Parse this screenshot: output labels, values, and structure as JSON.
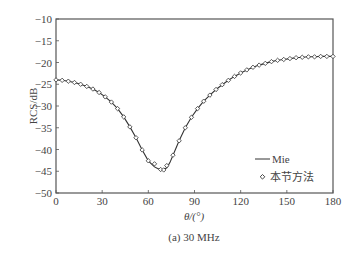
{
  "chart_data": {
    "type": "line",
    "title": "",
    "caption": "(a) 30 MHz",
    "xlabel": "θ/(°)",
    "ylabel": "RCS/dB",
    "xlim": [
      0,
      180
    ],
    "ylim": [
      -50,
      -10
    ],
    "xticks": [
      0,
      30,
      60,
      90,
      120,
      150,
      180
    ],
    "yticks": [
      -10,
      -15,
      -20,
      -25,
      -30,
      -35,
      -40,
      -45,
      -50
    ],
    "grid": false,
    "legend_position": "lower right",
    "series": [
      {
        "name": "Mie",
        "style": "solid-line",
        "x": [
          0,
          4,
          8,
          12,
          16,
          20,
          24,
          28,
          32,
          36,
          40,
          44,
          48,
          52,
          56,
          60,
          64,
          66,
          68,
          70,
          72,
          74,
          76,
          80,
          84,
          88,
          92,
          96,
          100,
          104,
          108,
          112,
          116,
          120,
          124,
          128,
          132,
          136,
          140,
          144,
          148,
          152,
          156,
          160,
          164,
          168,
          172,
          176,
          180
        ],
        "y": [
          -24.0,
          -24.1,
          -24.3,
          -24.6,
          -25.0,
          -25.5,
          -26.1,
          -26.9,
          -27.9,
          -29.1,
          -30.6,
          -32.5,
          -34.8,
          -37.3,
          -40.1,
          -42.6,
          -44.0,
          -44.4,
          -44.6,
          -44.6,
          -44.2,
          -43.0,
          -41.3,
          -38.0,
          -35.0,
          -32.6,
          -30.6,
          -28.9,
          -27.5,
          -26.2,
          -25.1,
          -24.1,
          -23.2,
          -22.4,
          -21.7,
          -21.1,
          -20.6,
          -20.2,
          -19.8,
          -19.5,
          -19.3,
          -19.1,
          -18.9,
          -18.8,
          -18.7,
          -18.7,
          -18.6,
          -18.6,
          -18.6
        ]
      },
      {
        "name": "本节方法",
        "style": "diamond-markers",
        "x": [
          0,
          4,
          8,
          12,
          16,
          20,
          24,
          28,
          32,
          36,
          40,
          44,
          48,
          52,
          56,
          60,
          64,
          68,
          70,
          72,
          76,
          80,
          84,
          88,
          92,
          96,
          100,
          104,
          108,
          112,
          116,
          120,
          124,
          128,
          132,
          136,
          140,
          144,
          148,
          152,
          156,
          160,
          164,
          168,
          172,
          176,
          180
        ],
        "y": [
          -24.0,
          -24.1,
          -24.3,
          -24.6,
          -25.0,
          -25.5,
          -26.1,
          -26.9,
          -27.9,
          -29.1,
          -30.6,
          -32.5,
          -34.8,
          -37.3,
          -40.1,
          -42.6,
          -43.3,
          -44.6,
          -44.7,
          -43.7,
          -41.3,
          -38.0,
          -35.0,
          -32.6,
          -30.6,
          -28.9,
          -27.5,
          -26.2,
          -25.1,
          -24.1,
          -23.2,
          -22.4,
          -21.7,
          -21.1,
          -20.6,
          -20.2,
          -19.8,
          -19.5,
          -19.3,
          -19.1,
          -18.9,
          -18.8,
          -18.7,
          -18.7,
          -18.6,
          -18.6,
          -18.6
        ]
      }
    ]
  },
  "legend": {
    "items": [
      {
        "label": "Mie"
      },
      {
        "label": "本节方法"
      }
    ]
  },
  "axes": {
    "xlabel": "θ/(°)",
    "ylabel": "RCS/dB",
    "caption": "(a) 30 MHz"
  }
}
